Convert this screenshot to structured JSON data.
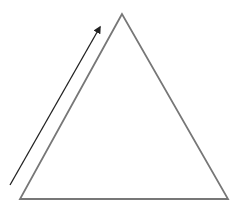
{
  "diagram": {
    "shapes": [
      {
        "kind": "triangle",
        "name": "triangle",
        "stroke": "#777777"
      },
      {
        "kind": "arrow",
        "name": "direction-arrow",
        "direction": "up-right along left edge",
        "stroke": "#222222"
      }
    ],
    "labels": []
  }
}
